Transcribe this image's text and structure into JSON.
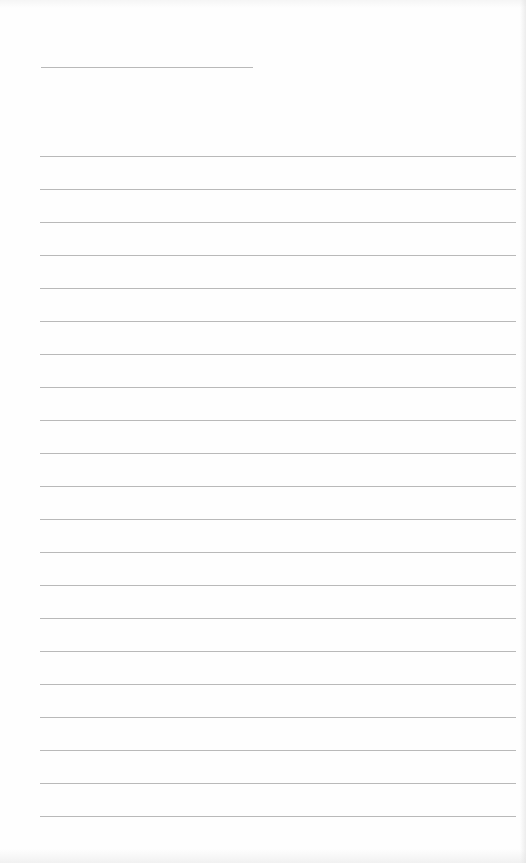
{
  "page": {
    "type": "lined-paper",
    "background_color": "#fefefe",
    "line_color": "#b9b9b9",
    "header_line": {
      "x": 41,
      "y": 67,
      "width": 212
    },
    "ruled_lines": {
      "count": 21,
      "x": 40,
      "width": 476,
      "y_positions": [
        156,
        189,
        222,
        255,
        288,
        321,
        354,
        387,
        420,
        453,
        486,
        519,
        552,
        585,
        618,
        651,
        684,
        717,
        750,
        783,
        816
      ]
    },
    "text_content": ""
  }
}
